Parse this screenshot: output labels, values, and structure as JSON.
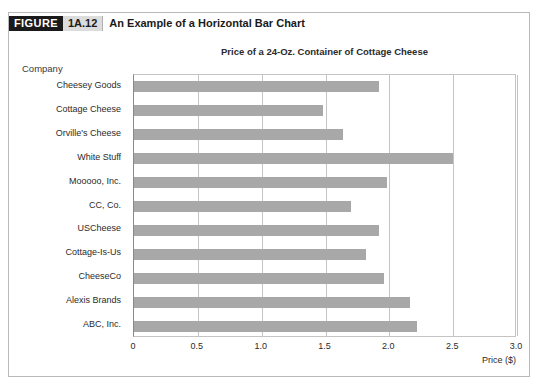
{
  "figure": {
    "label": "FIGURE",
    "number": "1A.12",
    "caption": "An Example of a Horizontal Bar Chart"
  },
  "colors": {
    "bar_fill": "#a8a8a8",
    "grid": "#c4c4c4",
    "axis": "#8a8a8a",
    "frame": "#b9b9b9",
    "figure_label_bg": "#1a1a1a",
    "figure_number_bg": "#dcdcdc",
    "text": "#231f20"
  },
  "chart_data": {
    "type": "bar",
    "orientation": "horizontal",
    "title": "Price of a 24-Oz. Container of Cottage Cheese",
    "xlabel": "Price ($)",
    "ylabel": "Company",
    "xlim": [
      0,
      3.0
    ],
    "xticks": [
      "0",
      "0.5",
      "1.0",
      "1.5",
      "2.0",
      "2.5",
      "3.0"
    ],
    "xtick_values": [
      0,
      0.5,
      1.0,
      1.5,
      2.0,
      2.5,
      3.0
    ],
    "grid": true,
    "legend": false,
    "categories": [
      "Cheesey Goods",
      "Cottage Cheese",
      "Orville's Cheese",
      "White Stuff",
      "Mooooo, Inc.",
      "CC, Co.",
      "USCheese",
      "Cottage-Is-Us",
      "CheeseCo",
      "Alexis Brands",
      "ABC, Inc."
    ],
    "values": [
      1.92,
      1.48,
      1.64,
      2.5,
      1.98,
      1.7,
      1.92,
      1.82,
      1.96,
      2.16,
      2.22
    ]
  }
}
